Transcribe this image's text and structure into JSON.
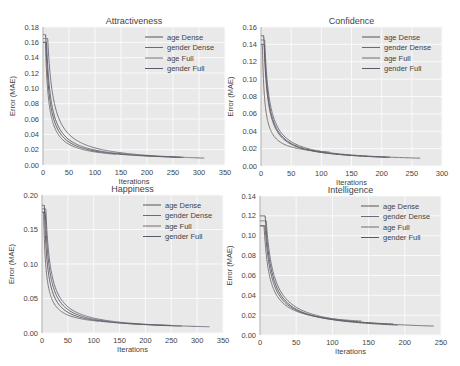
{
  "chart_data": [
    {
      "type": "line",
      "title": "Attractiveness",
      "xlabel": "Iterations",
      "ylabel": "Error (MAE)",
      "xlim": [
        0,
        350
      ],
      "ylim": [
        0,
        0.18
      ],
      "xticks": [
        0,
        50,
        100,
        150,
        200,
        250,
        300,
        350
      ],
      "yticks": [
        "0.00",
        "0.02",
        "0.04",
        "0.06",
        "0.08",
        "0.10",
        "0.12",
        "0.14",
        "0.16",
        "0.18"
      ],
      "grid": true,
      "legend_position": "upper right",
      "series": [
        {
          "name": "age Dense",
          "start": 0.17,
          "x_end": 265,
          "y_at_50": 0.03,
          "y_end": 0.01,
          "color": "#555555"
        },
        {
          "name": "gender Dense",
          "start": 0.165,
          "x_end": 310,
          "y_at_50": 0.04,
          "y_end": 0.009,
          "color": "#6a6a7a"
        },
        {
          "name": "age Full",
          "start": 0.16,
          "x_end": 140,
          "y_at_50": 0.027,
          "y_end": 0.014,
          "color": "#7a6a6a"
        },
        {
          "name": "gender Full",
          "start": 0.16,
          "x_end": 270,
          "y_at_50": 0.033,
          "y_end": 0.01,
          "color": "#5a5a6a"
        }
      ]
    },
    {
      "type": "line",
      "title": "Confidence",
      "xlabel": "Iterations",
      "ylabel": "Error (MAE)",
      "xlim": [
        0,
        300
      ],
      "ylim": [
        0,
        0.16
      ],
      "xticks": [
        0,
        50,
        100,
        150,
        200,
        250,
        300
      ],
      "yticks": [
        "0.00",
        "0.02",
        "0.04",
        "0.06",
        "0.08",
        "0.10",
        "0.12",
        "0.14",
        "0.16"
      ],
      "grid": true,
      "legend_position": "upper right",
      "series": [
        {
          "name": "age Dense",
          "start": 0.15,
          "x_end": 215,
          "y_at_50": 0.025,
          "y_end": 0.01,
          "color": "#555555"
        },
        {
          "name": "gender Dense",
          "start": 0.145,
          "x_end": 265,
          "y_at_50": 0.028,
          "y_end": 0.009,
          "color": "#6a6a7a"
        },
        {
          "name": "age Full",
          "start": 0.14,
          "x_end": 115,
          "y_at_50": 0.022,
          "y_end": 0.016,
          "color": "#7a6a6a"
        },
        {
          "name": "gender Full",
          "start": 0.14,
          "x_end": 210,
          "y_at_50": 0.026,
          "y_end": 0.01,
          "color": "#5a5a6a"
        }
      ]
    },
    {
      "type": "line",
      "title": "Happiness",
      "xlabel": "Iterations",
      "ylabel": "Error (MAE)",
      "xlim": [
        0,
        350
      ],
      "ylim": [
        0,
        0.2
      ],
      "xticks": [
        0,
        50,
        100,
        150,
        200,
        250,
        300,
        350
      ],
      "yticks": [
        "0.00",
        "0.05",
        "0.10",
        "0.15",
        "0.20"
      ],
      "grid": true,
      "legend_position": "upper right",
      "series": [
        {
          "name": "age Dense",
          "start": 0.185,
          "x_end": 250,
          "y_at_50": 0.03,
          "y_end": 0.011,
          "color": "#555555"
        },
        {
          "name": "gender Dense",
          "start": 0.18,
          "x_end": 325,
          "y_at_50": 0.038,
          "y_end": 0.009,
          "color": "#6a6a7a"
        },
        {
          "name": "age Full",
          "start": 0.175,
          "x_end": 110,
          "y_at_50": 0.026,
          "y_end": 0.017,
          "color": "#7a6a6a"
        },
        {
          "name": "gender Full",
          "start": 0.175,
          "x_end": 270,
          "y_at_50": 0.034,
          "y_end": 0.01,
          "color": "#5a5a6a"
        }
      ]
    },
    {
      "type": "line",
      "title": "Intelligence",
      "xlabel": "Iterations",
      "ylabel": "Error (MAE)",
      "xlim": [
        0,
        250
      ],
      "ylim": [
        0,
        0.14
      ],
      "xticks": [
        0,
        50,
        100,
        150,
        200,
        250
      ],
      "yticks": [
        "0.00",
        "0.02",
        "0.04",
        "0.06",
        "0.08",
        "0.10",
        "0.12",
        "0.14"
      ],
      "grid": true,
      "legend_position": "upper right",
      "series": [
        {
          "name": "age Dense",
          "start": 0.12,
          "x_end": 190,
          "y_at_50": 0.026,
          "y_end": 0.01,
          "color": "#555555"
        },
        {
          "name": "gender Dense",
          "start": 0.115,
          "x_end": 240,
          "y_at_50": 0.028,
          "y_end": 0.009,
          "color": "#6a6a7a"
        },
        {
          "name": "age Full",
          "start": 0.11,
          "x_end": 140,
          "y_at_50": 0.024,
          "y_end": 0.014,
          "color": "#7a6a6a"
        },
        {
          "name": "gender Full",
          "start": 0.11,
          "x_end": 185,
          "y_at_50": 0.025,
          "y_end": 0.011,
          "color": "#5a5a6a"
        }
      ]
    }
  ],
  "layout": {
    "panels": [
      {
        "left": 43,
        "top": 27,
        "width": 182,
        "height": 138
      },
      {
        "left": 261,
        "top": 27,
        "width": 181,
        "height": 139
      },
      {
        "left": 42,
        "top": 195,
        "width": 181,
        "height": 138
      },
      {
        "left": 260,
        "top": 196,
        "width": 181,
        "height": 139
      }
    ],
    "colors": {
      "plot_bg": "#e9e9e9",
      "grid": "#fafafa",
      "text": "#444444"
    }
  }
}
